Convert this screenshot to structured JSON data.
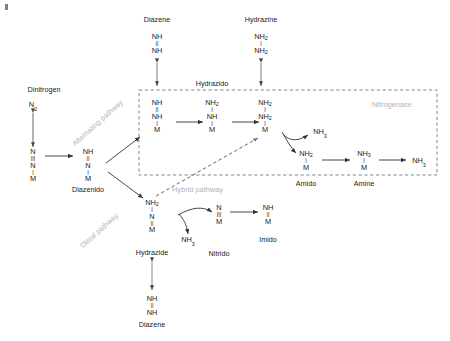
{
  "figure": {
    "type": "reaction-scheme",
    "background": "#ffffff",
    "ink_color": "#1a1a1a",
    "accent_gray": "#b3b3b3"
  },
  "enclosure": {
    "label": "Nitrogenase",
    "style": "dashed",
    "color": "#6e6e6e"
  },
  "pathways": [
    {
      "id": "alternating",
      "label": "Alternating pathway",
      "color": "#b3b3b3",
      "orientation": "diagonal"
    },
    {
      "id": "distal",
      "label": "Distal pathway",
      "color": "#b3b3b3",
      "orientation": "diagonal"
    },
    {
      "id": "hybrid",
      "label": "Hybrid pathway",
      "color": "#b3b3b3",
      "orientation": "horizontal"
    }
  ],
  "labels": {
    "dinitrogen": "Dinitrogen",
    "diazene_top": "Diazene",
    "hydrazine": "Hydrazine",
    "hydrazido": "Hydrazido",
    "diazenido": "Diazenido",
    "amido": "Amido",
    "amine": "Amine",
    "hydrazide": "Hydrazide",
    "nitrido": "Nitrido",
    "imido": "Imido",
    "diazene_bottom": "Diazene"
  },
  "species": {
    "dinitrogen_free": {
      "name": "Dinitrogen",
      "formula": "N2",
      "lines": [
        {
          "t": "N",
          "sub": "2"
        }
      ]
    },
    "n2_bound": {
      "name": "Dinitrogen complex",
      "formula": "N≡N-M",
      "lines": [
        {
          "t": "N"
        },
        {
          "bond": "|||"
        },
        {
          "t": "N"
        },
        {
          "bond": "|"
        },
        {
          "t": "M"
        }
      ]
    },
    "diazenido": {
      "name": "Diazenido",
      "formula": "NH=N-M",
      "lines": [
        {
          "t": "NH"
        },
        {
          "bond": "||"
        },
        {
          "t": "N"
        },
        {
          "bond": "|"
        },
        {
          "t": "M"
        }
      ]
    },
    "diazene_top": {
      "name": "Diazene",
      "formula": "NH=NH",
      "lines": [
        {
          "t": "NH"
        },
        {
          "bond": "||"
        },
        {
          "t": "NH"
        }
      ]
    },
    "hydrazine": {
      "name": "Hydrazine",
      "formula": "NH2-NH2",
      "lines": [
        {
          "t": "NH",
          "sub": "2"
        },
        {
          "bond": "|"
        },
        {
          "t": "NH",
          "sub": "2"
        }
      ]
    },
    "hydrazido_a": {
      "name": "Diazenido bound (hydrazido box entry)",
      "formula": "NH=NH-M",
      "lines": [
        {
          "t": "NH"
        },
        {
          "bond": "||"
        },
        {
          "t": "NH"
        },
        {
          "bond": "|"
        },
        {
          "t": "M"
        }
      ]
    },
    "hydrazido_b": {
      "name": "Hydrazido",
      "formula": "NH2-NH-M",
      "lines": [
        {
          "t": "NH",
          "sub": "2"
        },
        {
          "bond": "|"
        },
        {
          "t": "NH"
        },
        {
          "bond": "|"
        },
        {
          "t": "M"
        }
      ]
    },
    "hydrazido_c": {
      "name": "Hydrazine bound",
      "formula": "NH2-NH2-M",
      "lines": [
        {
          "t": "NH",
          "sub": "2"
        },
        {
          "bond": "|"
        },
        {
          "t": "NH",
          "sub": "2"
        },
        {
          "bond": "|"
        },
        {
          "t": "M"
        }
      ]
    },
    "amido": {
      "name": "Amido",
      "formula": "NH2-M",
      "lines": [
        {
          "t": "NH",
          "sub": "2"
        },
        {
          "bond": "|"
        },
        {
          "t": "M"
        }
      ]
    },
    "amine": {
      "name": "Amine",
      "formula": "NH3-M",
      "lines": [
        {
          "t": "NH",
          "sub": "3"
        },
        {
          "bond": "|"
        },
        {
          "t": "M"
        }
      ]
    },
    "hydrazide": {
      "name": "Hydrazide",
      "formula": "NH2-N=M",
      "lines": [
        {
          "t": "NH",
          "sub": "2"
        },
        {
          "bond": "|"
        },
        {
          "t": "N"
        },
        {
          "bond": "||"
        },
        {
          "t": "M"
        }
      ]
    },
    "nitrido": {
      "name": "Nitrido",
      "formula": "N≡M",
      "lines": [
        {
          "t": "N"
        },
        {
          "bond": "|||"
        },
        {
          "t": "M"
        }
      ]
    },
    "imido": {
      "name": "Imido",
      "formula": "NH=M",
      "lines": [
        {
          "t": "NH"
        },
        {
          "bond": "||"
        },
        {
          "t": "M"
        }
      ]
    },
    "diazene_bottom": {
      "name": "Diazene",
      "formula": "NH=NH",
      "lines": [
        {
          "t": "NH"
        },
        {
          "bond": "||"
        },
        {
          "t": "NH"
        }
      ]
    }
  },
  "byproducts": {
    "nh3_alt_release": {
      "formula": "NH3",
      "text": "NH",
      "sub": "3"
    },
    "nh3_terminal": {
      "formula": "NH3",
      "text": "NH",
      "sub": "3"
    },
    "nh3_distal": {
      "formula": "NH3",
      "text": "NH",
      "sub": "3"
    }
  },
  "arrows": [
    {
      "from": "dinitrogen_free",
      "to": "n2_bound",
      "type": "double-headed",
      "direction": "vertical"
    },
    {
      "from": "n2_bound",
      "to": "diazenido",
      "type": "single",
      "direction": "right"
    },
    {
      "from": "diazenido",
      "to": "hydrazido_a",
      "type": "single",
      "direction": "up-right"
    },
    {
      "from": "diazenido",
      "to": "hydrazide",
      "type": "single",
      "direction": "down-right"
    },
    {
      "from": "hydrazido_a",
      "to": "diazene_top",
      "type": "double-headed",
      "direction": "vertical"
    },
    {
      "from": "hydrazido_a",
      "to": "hydrazido_b",
      "type": "single",
      "direction": "right"
    },
    {
      "from": "hydrazido_b",
      "to": "hydrazido_c",
      "type": "single",
      "direction": "right"
    },
    {
      "from": "hydrazido_c",
      "to": "hydrazine",
      "type": "double-headed",
      "direction": "vertical"
    },
    {
      "from": "hydrazido_c",
      "to": "amido",
      "type": "curved",
      "releases": "NH3"
    },
    {
      "from": "amido",
      "to": "amine",
      "type": "single",
      "direction": "right"
    },
    {
      "from": "amine",
      "to": "nh3_terminal",
      "type": "single",
      "direction": "right"
    },
    {
      "from": "hydrazide",
      "to": "nitrido",
      "type": "curved",
      "releases": "NH3"
    },
    {
      "from": "nitrido",
      "to": "imido",
      "type": "single",
      "direction": "right"
    },
    {
      "from": "hydrazide",
      "to": "diazene_bottom",
      "type": "double-headed",
      "direction": "vertical"
    },
    {
      "from": "hybrid-origin",
      "to": "hydrazido_c",
      "type": "dashed",
      "direction": "up-right"
    }
  ]
}
